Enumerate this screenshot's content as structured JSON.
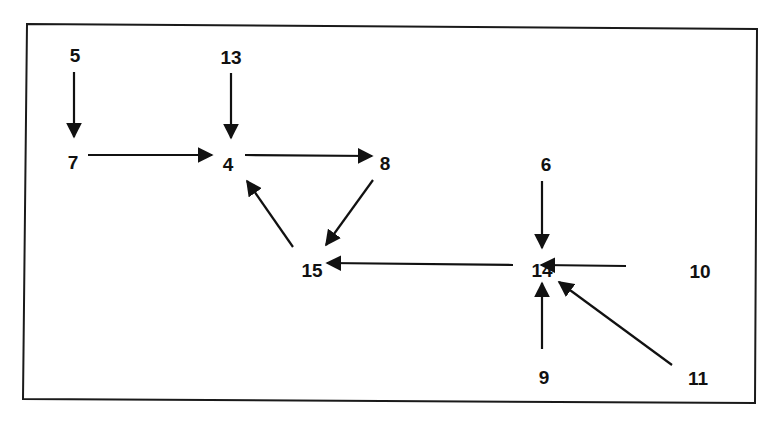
{
  "diagram": {
    "type": "directed-graph",
    "colors": {
      "background": "#ffffff",
      "ink": "#111111"
    },
    "nodes": [
      {
        "id": "5",
        "label": "5",
        "x": 75,
        "y": 57
      },
      {
        "id": "13",
        "label": "13",
        "x": 231,
        "y": 59
      },
      {
        "id": "7",
        "label": "7",
        "x": 73,
        "y": 164
      },
      {
        "id": "4",
        "label": "4",
        "x": 228,
        "y": 166
      },
      {
        "id": "8",
        "label": "8",
        "x": 385,
        "y": 165
      },
      {
        "id": "6",
        "label": "6",
        "x": 546,
        "y": 166
      },
      {
        "id": "15",
        "label": "15",
        "x": 312,
        "y": 272
      },
      {
        "id": "14",
        "label": "14",
        "x": 542,
        "y": 272
      },
      {
        "id": "10",
        "label": "10",
        "x": 700,
        "y": 273
      },
      {
        "id": "9",
        "label": "9",
        "x": 544,
        "y": 379
      },
      {
        "id": "11",
        "label": "11",
        "x": 698,
        "y": 380
      }
    ],
    "edges": [
      {
        "from": "5",
        "to": "7",
        "x1": 74,
        "y1": 72,
        "x2": 74,
        "y2": 137
      },
      {
        "from": "13",
        "to": "4",
        "x1": 231,
        "y1": 73,
        "x2": 231,
        "y2": 138
      },
      {
        "from": "7",
        "to": "4",
        "x1": 88,
        "y1": 155,
        "x2": 212,
        "y2": 155
      },
      {
        "from": "4",
        "to": "8",
        "x1": 245,
        "y1": 155,
        "x2": 372,
        "y2": 156
      },
      {
        "from": "15",
        "to": "4",
        "x1": 293,
        "y1": 247,
        "x2": 247,
        "y2": 181
      },
      {
        "from": "8",
        "to": "15",
        "x1": 373,
        "y1": 180,
        "x2": 326,
        "y2": 245
      },
      {
        "from": "14",
        "to": "15",
        "x1": 513,
        "y1": 265,
        "x2": 327,
        "y2": 263
      },
      {
        "from": "6",
        "to": "14",
        "x1": 542,
        "y1": 181,
        "x2": 542,
        "y2": 248
      },
      {
        "from": "10",
        "to": "14",
        "x1": 626,
        "y1": 266,
        "x2": 541,
        "y2": 265
      },
      {
        "from": "9",
        "to": "14",
        "x1": 542,
        "y1": 349,
        "x2": 542,
        "y2": 283
      },
      {
        "from": "11",
        "to": "14",
        "x1": 672,
        "y1": 365,
        "x2": 559,
        "y2": 282
      }
    ]
  }
}
